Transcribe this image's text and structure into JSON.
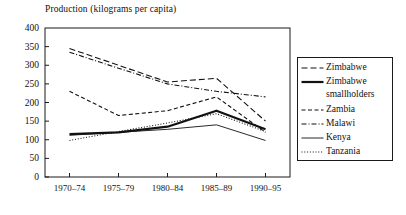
{
  "chart_data": {
    "type": "line",
    "title": "Production (kilograms per capita)",
    "xlabel": "",
    "ylabel": "",
    "ylim": [
      0,
      400
    ],
    "yticks": [
      0,
      50,
      100,
      150,
      200,
      250,
      300,
      350,
      400
    ],
    "grid": false,
    "legend_position": "right",
    "categories": [
      "1970–74",
      "1975–79",
      "1980–84",
      "1985–89",
      "1990–95"
    ],
    "series": [
      {
        "name": "Zimbabwe",
        "style": "dashed",
        "color": "#111111",
        "width": 1.1,
        "values": [
          345,
          300,
          255,
          265,
          150
        ]
      },
      {
        "name": "Zimbabwe smallholders",
        "style": "solid-thick",
        "color": "#111111",
        "width": 2.2,
        "values": [
          115,
          120,
          135,
          178,
          128
        ]
      },
      {
        "name": "Zambia",
        "style": "short-dash",
        "color": "#111111",
        "width": 1.1,
        "values": [
          230,
          165,
          178,
          215,
          120
        ]
      },
      {
        "name": "Malawi",
        "style": "dash-dot",
        "color": "#111111",
        "width": 1.1,
        "values": [
          335,
          292,
          250,
          230,
          215
        ]
      },
      {
        "name": "Kenya",
        "style": "solid-thin",
        "color": "#111111",
        "width": 0.9,
        "values": [
          112,
          120,
          128,
          140,
          98
        ]
      },
      {
        "name": "Tanzania",
        "style": "dotted",
        "color": "#111111",
        "width": 1.1,
        "values": [
          98,
          122,
          145,
          170,
          122
        ]
      }
    ]
  },
  "legend": {
    "items": [
      {
        "label": "Zimbabwe",
        "continuation": ""
      },
      {
        "label": "Zimbabwe",
        "continuation": "smallholders"
      },
      {
        "label": "Zambia",
        "continuation": ""
      },
      {
        "label": "Malawi",
        "continuation": ""
      },
      {
        "label": "Kenya",
        "continuation": ""
      },
      {
        "label": "Tanzania",
        "continuation": ""
      }
    ]
  }
}
